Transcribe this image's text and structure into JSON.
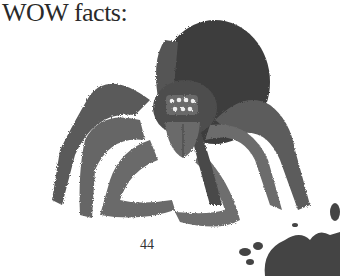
{
  "heading": "WOW facts:",
  "page_number": "44",
  "illustration": {
    "subject": "tarantula-spider",
    "palette": [
      "#3a3a3a",
      "#5a5a5a",
      "#7a7a7a",
      "#9a9a9a"
    ]
  },
  "decoration": "ink-splatter"
}
